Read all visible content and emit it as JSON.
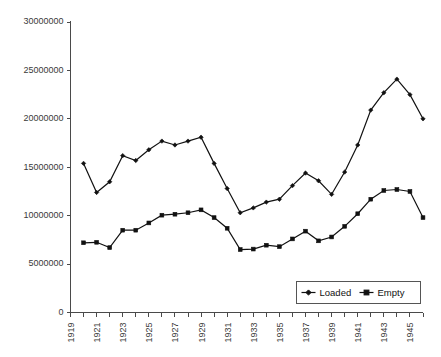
{
  "chart_data": {
    "type": "line",
    "title": "",
    "subtitle": "",
    "xlabel": "",
    "ylabel": "",
    "xlim": [
      1919,
      1946
    ],
    "ylim": [
      0,
      30000000
    ],
    "grid": false,
    "legend_position": "bottom-right",
    "x": [
      1920,
      1921,
      1922,
      1923,
      1924,
      1925,
      1926,
      1927,
      1928,
      1929,
      1930,
      1931,
      1932,
      1933,
      1934,
      1935,
      1936,
      1937,
      1938,
      1939,
      1940,
      1941,
      1942,
      1943,
      1944,
      1945,
      1946
    ],
    "x_tick_labels": [
      "1919",
      "1921",
      "1923",
      "1925",
      "1927",
      "1929",
      "1931",
      "1933",
      "1935",
      "1937",
      "1939",
      "1941",
      "1943",
      "1945"
    ],
    "x_tick_values": [
      1919,
      1921,
      1923,
      1925,
      1927,
      1929,
      1931,
      1933,
      1935,
      1937,
      1939,
      1941,
      1943,
      1945
    ],
    "y_tick_labels": [
      "0",
      "5000000",
      "10000000",
      "15000000",
      "20000000",
      "25000000",
      "30000000"
    ],
    "y_tick_values": [
      0,
      5000000,
      10000000,
      15000000,
      20000000,
      25000000,
      30000000
    ],
    "series": [
      {
        "name": "Loaded",
        "marker": "diamond",
        "color": "#111111",
        "values": [
          15400000,
          12400000,
          13500000,
          16200000,
          15700000,
          16800000,
          17700000,
          17300000,
          17700000,
          18100000,
          15400000,
          12800000,
          10300000,
          10800000,
          11400000,
          11700000,
          13100000,
          14400000,
          13600000,
          12200000,
          14500000,
          17300000,
          20900000,
          22700000,
          24100000,
          22500000,
          20000000
        ]
      },
      {
        "name": "Empty",
        "marker": "square",
        "color": "#111111",
        "values": [
          7200000,
          7250000,
          6700000,
          8500000,
          8500000,
          9250000,
          10050000,
          10150000,
          10300000,
          10600000,
          9800000,
          8700000,
          6500000,
          6550000,
          6950000,
          6800000,
          7600000,
          8400000,
          7400000,
          7800000,
          8900000,
          10200000,
          11700000,
          12600000,
          12700000,
          12500000,
          9800000
        ]
      }
    ]
  },
  "legend": {
    "items": [
      {
        "label": "Loaded"
      },
      {
        "label": "Empty"
      }
    ]
  }
}
